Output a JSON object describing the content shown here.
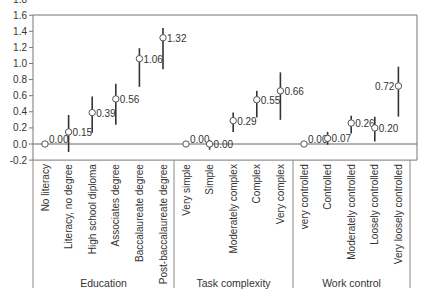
{
  "chart_data": {
    "type": "scatter",
    "subtype": "point-estimate-with-error-bars",
    "title": "",
    "xlabel": "",
    "ylabel": "",
    "ylim": [
      -0.2,
      1.8
    ],
    "yticks": [
      "1.8",
      "1.6",
      "1.4",
      "1.2",
      "1.0",
      "0.8",
      "0.6",
      "0.4",
      "0.2",
      "0.0",
      "-0.2"
    ],
    "ytick_values": [
      1.8,
      1.6,
      1.4,
      1.2,
      1.0,
      0.8,
      0.6,
      0.4,
      0.2,
      0.0,
      -0.2
    ],
    "grid": false,
    "zero_line": true,
    "legend": null,
    "groups": [
      {
        "name": "Education",
        "categories": [
          "No literacy",
          "Literacy, no degree",
          "High school diploma",
          "Associates degree",
          "Baccalaureate degree",
          "Post-baccalaureate degree"
        ],
        "values": [
          0.0,
          0.15,
          0.39,
          0.56,
          1.06,
          1.32
        ],
        "labels": [
          "0.00",
          "0.15",
          "0.39",
          "0.56",
          "1.06",
          "1.32"
        ],
        "ci_low": [
          null,
          -0.1,
          0.14,
          0.24,
          0.71,
          0.93
        ],
        "ci_high": [
          null,
          0.36,
          0.59,
          0.75,
          1.19,
          1.44
        ],
        "label_side": [
          "right",
          "right",
          "right",
          "right",
          "right",
          "right"
        ]
      },
      {
        "name": "Task complexity",
        "categories": [
          "Very simple",
          "Simple",
          "Moderately complex",
          "Complex",
          "Very complex"
        ],
        "values": [
          0.0,
          0.0,
          0.29,
          0.55,
          0.66
        ],
        "labels": [
          "0.00",
          "0.00",
          "0.29",
          "0.55",
          "0.66"
        ],
        "ci_low": [
          null,
          -0.07,
          0.15,
          0.33,
          0.3
        ],
        "ci_high": [
          null,
          0.05,
          0.39,
          0.66,
          0.89
        ],
        "label_side": [
          "right",
          "right",
          "right",
          "right",
          "right"
        ]
      },
      {
        "name": "Work control",
        "categories": [
          "very controlled",
          "Controlled",
          "Moderately controlled",
          "Loosely controlled",
          "Very loosely controlled"
        ],
        "values": [
          0.0,
          0.07,
          0.26,
          0.2,
          0.72
        ],
        "labels": [
          "0.00",
          "0.07",
          "0.26",
          "0.20",
          "0.72"
        ],
        "ci_low": [
          null,
          -0.01,
          0.13,
          0.03,
          0.34
        ],
        "ci_high": [
          null,
          0.15,
          0.35,
          0.34,
          0.96
        ],
        "label_side": [
          "right",
          "right",
          "right",
          "right",
          "left"
        ]
      }
    ]
  },
  "colors": {
    "axis": "#777777",
    "errorbar": "#333333",
    "marker_fill": "#ffffff",
    "marker_stroke": "#555555",
    "text": "#333333"
  }
}
